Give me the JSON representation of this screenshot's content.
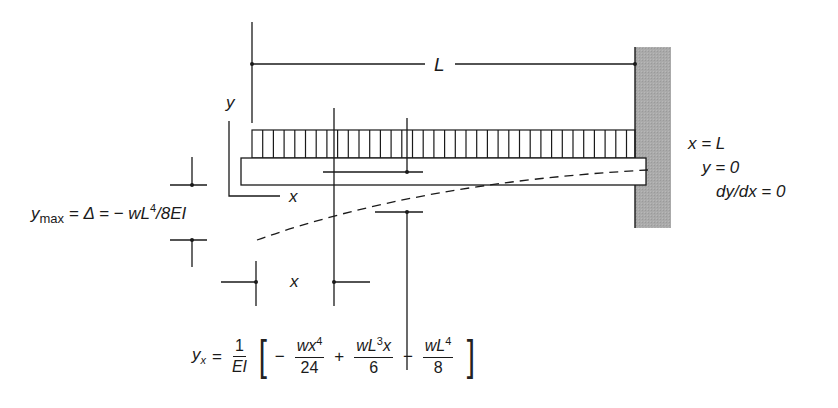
{
  "diagram": {
    "labels": {
      "span": "L",
      "axis_y": "y",
      "axis_x": "x",
      "position_x": "x"
    },
    "boundary_conditions": {
      "line1": "x = L",
      "line2": "y = 0",
      "line3": "dy/dx = 0"
    },
    "max_deflection": {
      "lhs_main": "y",
      "lhs_sub": "max",
      "rest": " = Δ = − wL",
      "exp": "4",
      "tail": "/8EI"
    },
    "deflection_equation": {
      "lhs_main": "y",
      "lhs_sub": "x",
      "equals": "=",
      "coef_num": "1",
      "coef_den": "EI",
      "open_bracket": "[",
      "close_bracket": "]",
      "term1_sign": "−",
      "term1_num": "wx",
      "term1_exp": "4",
      "term1_den": "24",
      "term2_sign": "+",
      "term2_num_a": "wL",
      "term2_exp": "3",
      "term2_num_b": "x",
      "term2_den": "6",
      "term3_sign": "−",
      "term3_num": "wL",
      "term3_exp": "4",
      "term3_den": "8"
    },
    "colors": {
      "line": "#1a1a1a",
      "wall_fill": "#a9a9a9",
      "background": "#ffffff"
    }
  }
}
